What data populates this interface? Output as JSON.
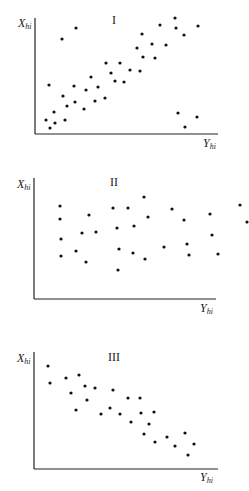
{
  "chart_data": [
    {
      "type": "scatter",
      "title": "I",
      "xlabel": "Y_hi",
      "ylabel": "X_hi",
      "grid": false,
      "axis_pixels": {
        "x0": 35,
        "y_top": 18,
        "y0": 134,
        "x_end": 218
      },
      "points": [
        [
          62,
          39
        ],
        [
          76,
          28
        ],
        [
          49,
          85
        ],
        [
          46,
          120
        ],
        [
          50,
          128
        ],
        [
          54,
          112
        ],
        [
          55,
          123
        ],
        [
          63,
          96
        ],
        [
          67,
          106
        ],
        [
          65,
          120
        ],
        [
          74,
          86
        ],
        [
          75,
          102
        ],
        [
          84,
          109
        ],
        [
          86,
          90
        ],
        [
          91,
          77
        ],
        [
          95,
          101
        ],
        [
          98,
          87
        ],
        [
          105,
          98
        ],
        [
          106,
          63
        ],
        [
          111,
          73
        ],
        [
          115,
          81
        ],
        [
          120,
          63
        ],
        [
          124,
          82
        ],
        [
          130,
          70
        ],
        [
          137,
          48
        ],
        [
          140,
          71
        ],
        [
          142,
          34
        ],
        [
          143,
          57
        ],
        [
          152,
          44
        ],
        [
          155,
          58
        ],
        [
          160,
          25
        ],
        [
          166,
          45
        ],
        [
          175,
          18
        ],
        [
          176,
          28
        ],
        [
          184,
          35
        ],
        [
          198,
          26
        ],
        [
          178,
          113
        ],
        [
          185,
          127
        ],
        [
          197,
          117
        ]
      ]
    },
    {
      "type": "scatter",
      "title": "II",
      "xlabel": "Y_hi",
      "ylabel": "X_hi",
      "grid": false,
      "axis_pixels": {
        "x0": 34,
        "y_top": 178,
        "y0": 299,
        "x_end": 216
      },
      "points": [
        [
          60,
          206
        ],
        [
          60,
          219
        ],
        [
          61,
          239
        ],
        [
          61,
          256
        ],
        [
          76,
          251
        ],
        [
          86,
          262
        ],
        [
          82,
          233
        ],
        [
          89,
          215
        ],
        [
          96,
          232
        ],
        [
          113,
          208
        ],
        [
          128,
          208
        ],
        [
          144,
          197
        ],
        [
          148,
          217
        ],
        [
          117,
          228
        ],
        [
          134,
          226
        ],
        [
          119,
          249
        ],
        [
          133,
          253
        ],
        [
          118,
          270
        ],
        [
          145,
          259
        ],
        [
          164,
          247
        ],
        [
          172,
          209
        ],
        [
          184,
          220
        ],
        [
          210,
          214
        ],
        [
          212,
          235
        ],
        [
          187,
          244
        ],
        [
          189,
          255
        ],
        [
          218,
          254
        ],
        [
          240,
          205
        ],
        [
          247,
          222
        ]
      ]
    },
    {
      "type": "scatter",
      "title": "III",
      "xlabel": "Y_hi",
      "ylabel": "X_hi",
      "grid": false,
      "axis_pixels": {
        "x0": 34,
        "y_top": 352,
        "y0": 469,
        "x_end": 218
      },
      "points": [
        [
          48,
          366
        ],
        [
          50,
          383
        ],
        [
          66,
          378
        ],
        [
          71,
          393
        ],
        [
          76,
          410
        ],
        [
          79,
          375
        ],
        [
          85,
          386
        ],
        [
          87,
          400
        ],
        [
          95,
          388
        ],
        [
          101,
          414
        ],
        [
          110,
          408
        ],
        [
          113,
          390
        ],
        [
          120,
          414
        ],
        [
          128,
          398
        ],
        [
          131,
          422
        ],
        [
          140,
          398
        ],
        [
          141,
          413
        ],
        [
          144,
          434
        ],
        [
          149,
          424
        ],
        [
          154,
          412
        ],
        [
          155,
          442
        ],
        [
          167,
          437
        ],
        [
          175,
          446
        ],
        [
          185,
          433
        ],
        [
          194,
          444
        ],
        [
          188,
          455
        ]
      ]
    }
  ],
  "panels": [
    {
      "roman": "I",
      "ylabel_main": "X",
      "ylabel_sub": "hi",
      "xlabel_main": "Y",
      "xlabel_sub": "hi"
    },
    {
      "roman": "II",
      "ylabel_main": "X",
      "ylabel_sub": "hi",
      "xlabel_main": "Y",
      "xlabel_sub": "hi"
    },
    {
      "roman": "III",
      "ylabel_main": "X",
      "ylabel_sub": "hi",
      "xlabel_main": "Y",
      "xlabel_sub": "hi"
    }
  ],
  "colors": {
    "dot": "#111111",
    "axis": "#222222",
    "background": "#ffffff"
  }
}
